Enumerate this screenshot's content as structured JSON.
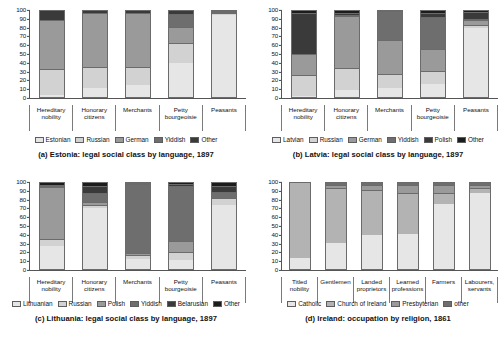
{
  "figure": {
    "background": "#ffffff",
    "panels": [
      "a",
      "b",
      "c",
      "d"
    ]
  },
  "palette": {
    "light": "#e6e6e6",
    "light2": "#d2d2d2",
    "mid": "#b3b3b3",
    "mid2": "#9a9a9a",
    "dark": "#6e6e6e",
    "darkest": "#3a3a3a",
    "black": "#1c1c1c"
  },
  "panel_a": {
    "caption": "(a) Estonia: legal social class by language, 1897",
    "yticks": [
      "100",
      "90",
      "80",
      "70",
      "60",
      "50",
      "40",
      "30",
      "20",
      "10",
      "0"
    ],
    "categories": [
      "Hereditary nobility",
      "Honorary citizens",
      "Merchants",
      "Petty bourgeoisie",
      "Peasants"
    ],
    "legend": [
      "Estonian",
      "Russian",
      "German",
      "Yiddish",
      "Other"
    ]
  },
  "panel_b": {
    "caption": "(b) Latvia: legal social class by language, 1897",
    "yticks": [
      "100",
      "90",
      "80",
      "70",
      "60",
      "50",
      "40",
      "30",
      "20",
      "10",
      "0"
    ],
    "categories": [
      "Hereditary nobility",
      "Honorary citizens",
      "Merchants",
      "Petty bourgeoisie",
      "Peasants"
    ],
    "legend": [
      "Latvian",
      "Russian",
      "German",
      "Yiddish",
      "Polish",
      "Other"
    ]
  },
  "panel_c": {
    "caption": "(c) Lithuania: legal social class by language, 1897",
    "yticks": [
      "100",
      "90",
      "80",
      "70",
      "60",
      "50",
      "40",
      "30",
      "20",
      "10",
      "0"
    ],
    "categories": [
      "Hereditary nobility",
      "Honorary citizens",
      "Merchants",
      "Petty bourgeoisie",
      "Peasants"
    ],
    "legend": [
      "Lithuanian",
      "Russian",
      "Polish",
      "Yiddish",
      "Belarusian",
      "Other"
    ]
  },
  "panel_d": {
    "caption": "(d) Ireland: occupation by religion, 1861",
    "yticks": [
      "100",
      "90",
      "80",
      "70",
      "60",
      "50",
      "40",
      "30",
      "20",
      "10",
      "0"
    ],
    "categories": [
      "Titled nobility",
      "Gentlemen",
      "Landed proprietors",
      "Learned professions",
      "Farmers",
      "Labourers, servants"
    ],
    "legend": [
      "Catholic",
      "Church of Ireland",
      "Presbyterian",
      "other"
    ]
  },
  "chart_data": [
    {
      "type": "bar",
      "stacked": true,
      "percent": true,
      "panel": "a",
      "title": "(a) Estonia: legal social class by language, 1897",
      "xlabel": "",
      "ylabel": "",
      "ylim": [
        0,
        100
      ],
      "yticks": [
        0,
        10,
        20,
        30,
        40,
        50,
        60,
        70,
        80,
        90,
        100
      ],
      "grid": false,
      "legend_position": "bottom",
      "categories": [
        "Hereditary nobility",
        "Honorary citizens",
        "Merchants",
        "Petty bourgeoisie",
        "Peasants"
      ],
      "series": [
        {
          "name": "Estonian",
          "color": "#e6e6e6",
          "values": [
            2,
            10,
            14,
            40,
            95
          ]
        },
        {
          "name": "Russian",
          "color": "#d2d2d2",
          "values": [
            29,
            24,
            20,
            22,
            2
          ]
        },
        {
          "name": "German",
          "color": "#9a9a9a",
          "values": [
            57,
            62,
            62,
            18,
            1
          ]
        },
        {
          "name": "Yiddish",
          "color": "#6e6e6e",
          "values": [
            0,
            1,
            1,
            15,
            1
          ]
        },
        {
          "name": "Other",
          "color": "#3a3a3a",
          "values": [
            12,
            3,
            3,
            5,
            1
          ]
        }
      ]
    },
    {
      "type": "bar",
      "stacked": true,
      "percent": true,
      "panel": "b",
      "title": "(b) Latvia: legal social class by language, 1897",
      "xlabel": "",
      "ylabel": "",
      "ylim": [
        0,
        100
      ],
      "yticks": [
        0,
        10,
        20,
        30,
        40,
        50,
        60,
        70,
        80,
        90,
        100
      ],
      "grid": false,
      "legend_position": "bottom",
      "categories": [
        "Hereditary nobility",
        "Honorary citizens",
        "Merchants",
        "Petty bourgeoisie",
        "Peasants"
      ],
      "series": [
        {
          "name": "Latvian",
          "color": "#e6e6e6",
          "values": [
            1,
            8,
            10,
            15,
            80
          ]
        },
        {
          "name": "Russian",
          "color": "#d2d2d2",
          "values": [
            23,
            25,
            16,
            14,
            2
          ]
        },
        {
          "name": "German",
          "color": "#9a9a9a",
          "values": [
            25,
            60,
            39,
            26,
            6
          ]
        },
        {
          "name": "Yiddish",
          "color": "#6e6e6e",
          "values": [
            0,
            1,
            34,
            37,
            2
          ]
        },
        {
          "name": "Polish",
          "color": "#3a3a3a",
          "values": [
            48,
            3,
            1,
            5,
            8
          ]
        },
        {
          "name": "Other",
          "color": "#1c1c1c",
          "values": [
            3,
            3,
            0,
            3,
            2
          ]
        }
      ]
    },
    {
      "type": "bar",
      "stacked": true,
      "percent": true,
      "panel": "c",
      "title": "(c) Lithuania: legal social class by language, 1897",
      "xlabel": "",
      "ylabel": "",
      "ylim": [
        0,
        100
      ],
      "yticks": [
        0,
        10,
        20,
        30,
        40,
        50,
        60,
        70,
        80,
        90,
        100
      ],
      "grid": false,
      "legend_position": "bottom",
      "categories": [
        "Hereditary nobility",
        "Honorary citizens",
        "Merchants",
        "Petty bourgeoisie",
        "Peasants"
      ],
      "series": [
        {
          "name": "Lithuanian",
          "color": "#e6e6e6",
          "values": [
            27,
            71,
            12,
            11,
            74
          ]
        },
        {
          "name": "Russian",
          "color": "#d2d2d2",
          "values": [
            7,
            2,
            3,
            8,
            7
          ]
        },
        {
          "name": "Polish",
          "color": "#9a9a9a",
          "values": [
            60,
            4,
            2,
            13,
            1
          ]
        },
        {
          "name": "Yiddish",
          "color": "#6e6e6e",
          "values": [
            1,
            10,
            81,
            63,
            6
          ]
        },
        {
          "name": "Belarusian",
          "color": "#3a3a3a",
          "values": [
            2,
            8,
            1,
            3,
            7
          ]
        },
        {
          "name": "Other",
          "color": "#1c1c1c",
          "values": [
            3,
            5,
            1,
            2,
            5
          ]
        }
      ]
    },
    {
      "type": "bar",
      "stacked": true,
      "percent": true,
      "panel": "d",
      "title": "(d) Ireland: occupation by religion, 1861",
      "xlabel": "",
      "ylabel": "",
      "ylim": [
        0,
        100
      ],
      "yticks": [
        0,
        10,
        20,
        30,
        40,
        50,
        60,
        70,
        80,
        90,
        100
      ],
      "grid": false,
      "legend_position": "bottom",
      "categories": [
        "Titled nobility",
        "Gentlemen",
        "Landed proprietors",
        "Learned professions",
        "Farmers",
        "Labourers, servants"
      ],
      "series": [
        {
          "name": "Catholic",
          "color": "#e6e6e6",
          "values": [
            13,
            30,
            40,
            41,
            76,
            88
          ]
        },
        {
          "name": "Church of Ireland",
          "color": "#b3b3b3",
          "values": [
            87,
            63,
            51,
            46,
            11,
            5
          ]
        },
        {
          "name": "Presbyterian",
          "color": "#9a9a9a",
          "values": [
            0,
            3,
            5,
            9,
            10,
            4
          ]
        },
        {
          "name": "other",
          "color": "#6e6e6e",
          "values": [
            0,
            4,
            4,
            4,
            3,
            3
          ]
        }
      ]
    }
  ]
}
